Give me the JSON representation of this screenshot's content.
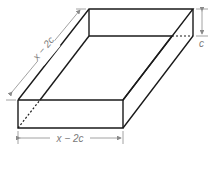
{
  "diagram": {
    "labels": {
      "depth": "x − 2c",
      "width": "x − 2c",
      "height": "c"
    },
    "colors": {
      "edge": "#1a1a1a",
      "dimension": "#8a8a8a",
      "label": "#7a7a7a"
    }
  }
}
